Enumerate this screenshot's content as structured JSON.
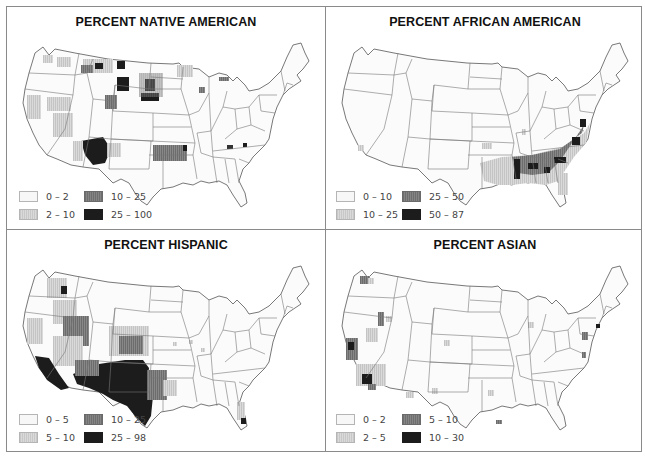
{
  "figure": {
    "panels": [
      {
        "id": "native-american",
        "title": "PERCENT NATIVE AMERICAN",
        "legend": [
          {
            "label": "0 – 2",
            "shade": "lightest"
          },
          {
            "label": "2 – 10",
            "shade": "light"
          },
          {
            "label": "10 – 25",
            "shade": "medium"
          },
          {
            "label": "25 – 100",
            "shade": "dark"
          }
        ],
        "high_concentration_regions": [
          "Four Corners (AZ/NM/UT)",
          "Dakotas reservations",
          "Montana reservations",
          "Oklahoma"
        ]
      },
      {
        "id": "african-american",
        "title": "PERCENT AFRICAN AMERICAN",
        "legend": [
          {
            "label": "0 – 10",
            "shade": "lightest"
          },
          {
            "label": "10 – 25",
            "shade": "light"
          },
          {
            "label": "25 – 50",
            "shade": "medium"
          },
          {
            "label": "50 – 87",
            "shade": "dark"
          }
        ],
        "high_concentration_regions": [
          "Mississippi Delta",
          "Alabama Black Belt",
          "Georgia",
          "South Carolina",
          "Eastern North Carolina",
          "Virginia"
        ]
      },
      {
        "id": "hispanic",
        "title": "PERCENT HISPANIC",
        "legend": [
          {
            "label": "0 – 5",
            "shade": "lightest"
          },
          {
            "label": "5 – 10",
            "shade": "light"
          },
          {
            "label": "10 – 25",
            "shade": "medium"
          },
          {
            "label": "25 – 98",
            "shade": "dark"
          }
        ],
        "high_concentration_regions": [
          "Southern California",
          "Arizona",
          "New Mexico",
          "South & West Texas",
          "South Florida"
        ]
      },
      {
        "id": "asian",
        "title": "PERCENT ASIAN",
        "legend": [
          {
            "label": "0 – 2",
            "shade": "lightest"
          },
          {
            "label": "2 – 5",
            "shade": "light"
          },
          {
            "label": "5 – 10",
            "shade": "medium"
          },
          {
            "label": "10 – 30",
            "shade": "dark"
          }
        ],
        "high_concentration_regions": [
          "San Francisco Bay Area",
          "Los Angeles",
          "Seattle",
          "New York",
          "Washington DC area"
        ]
      }
    ],
    "colors": {
      "lightest": "#f7f7f7",
      "light": "#d0d0d0",
      "medium": "#7a7a7a",
      "dark": "#1c1c1c",
      "border": "#8a8a8a",
      "state_line": "#6e6e6e"
    }
  }
}
